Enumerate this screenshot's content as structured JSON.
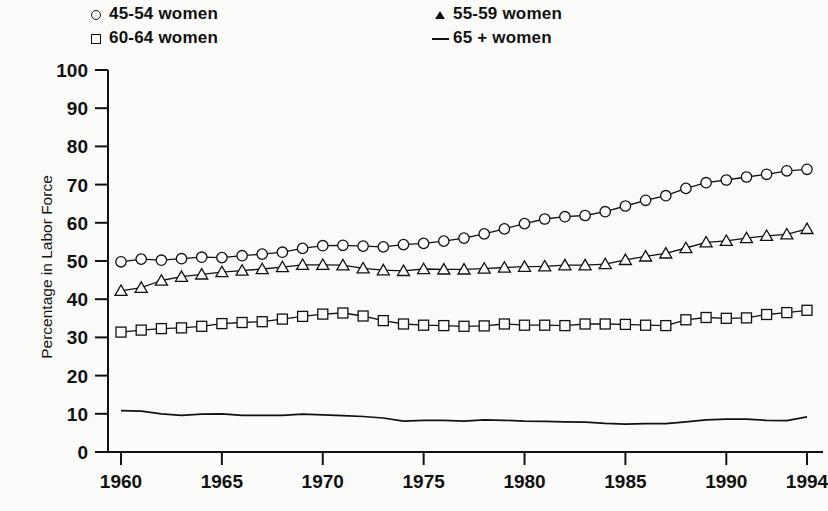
{
  "legend": {
    "columns": [
      {
        "entries": [
          {
            "marker": "circle-marker-icon",
            "label": "45-54 women"
          },
          {
            "marker": "square-marker-icon",
            "label": "60-64 women"
          }
        ]
      },
      {
        "entries": [
          {
            "marker": "triangle-marker-icon",
            "label": "55-59 women"
          },
          {
            "marker": "line-marker-icon",
            "label": "65 + women"
          }
        ]
      }
    ]
  },
  "axes": {
    "ylabel": "Percentage in Labor Force",
    "xlabel": "",
    "y_ticks": [
      "100",
      "90",
      "80",
      "70",
      "60",
      "50",
      "40",
      "30",
      "20",
      "10",
      "0"
    ],
    "x_ticks": [
      "1960",
      "1965",
      "1970",
      "1975",
      "1980",
      "1985",
      "1990",
      "1994"
    ]
  },
  "colors": {
    "ink": "#111111",
    "paper": "#fbfbf9"
  },
  "chart_data": {
    "type": "line",
    "title": "",
    "subtitle": "",
    "xlabel": "",
    "ylabel": "Percentage in Labor Force",
    "xlim": [
      1960,
      1994
    ],
    "ylim": [
      0,
      100
    ],
    "ytick_values": [
      0,
      10,
      20,
      30,
      40,
      50,
      60,
      70,
      80,
      90,
      100
    ],
    "xtick_values": [
      1960,
      1965,
      1970,
      1975,
      1980,
      1985,
      1990,
      1994
    ],
    "grid": false,
    "legend_position": "top",
    "x": [
      1960,
      1961,
      1962,
      1963,
      1964,
      1965,
      1966,
      1967,
      1968,
      1969,
      1970,
      1971,
      1972,
      1973,
      1974,
      1975,
      1976,
      1977,
      1978,
      1979,
      1980,
      1981,
      1982,
      1983,
      1984,
      1985,
      1986,
      1987,
      1988,
      1989,
      1990,
      1991,
      1992,
      1993,
      1994
    ],
    "series": [
      {
        "name": "45-54 women",
        "marker": "circle",
        "values": [
          49.8,
          50.5,
          50.2,
          50.6,
          51.0,
          50.9,
          51.4,
          51.8,
          52.3,
          53.3,
          54.0,
          54.1,
          53.9,
          53.7,
          54.3,
          54.6,
          55.2,
          56.0,
          57.1,
          58.4,
          59.8,
          61.0,
          61.6,
          61.9,
          62.9,
          64.4,
          65.9,
          67.1,
          69.0,
          70.5,
          71.2,
          72.0,
          72.7,
          73.6,
          74.0
        ]
      },
      {
        "name": "55-59 women",
        "marker": "triangle",
        "values": [
          42.2,
          43.0,
          44.9,
          45.9,
          46.5,
          47.1,
          47.5,
          47.9,
          48.4,
          49.0,
          49.0,
          48.9,
          48.1,
          47.6,
          47.4,
          47.9,
          47.8,
          47.8,
          48.0,
          48.3,
          48.5,
          48.6,
          48.9,
          48.9,
          49.2,
          50.3,
          51.2,
          52.0,
          53.4,
          54.9,
          55.3,
          56.0,
          56.6,
          57.0,
          58.4
        ]
      },
      {
        "name": "60-64 women",
        "marker": "square",
        "values": [
          31.4,
          31.9,
          32.3,
          32.5,
          32.9,
          33.6,
          33.9,
          34.1,
          34.8,
          35.5,
          36.1,
          36.4,
          35.6,
          34.4,
          33.5,
          33.2,
          33.1,
          32.9,
          33.0,
          33.5,
          33.2,
          33.2,
          33.1,
          33.5,
          33.5,
          33.4,
          33.2,
          33.1,
          34.6,
          35.2,
          35.0,
          35.1,
          36.0,
          36.5,
          37.1
        ]
      },
      {
        "name": "65 + women",
        "marker": "none",
        "values": [
          10.8,
          10.7,
          10.0,
          9.6,
          9.9,
          10.0,
          9.6,
          9.6,
          9.6,
          9.9,
          9.7,
          9.5,
          9.3,
          8.9,
          8.1,
          8.3,
          8.3,
          8.1,
          8.4,
          8.3,
          8.1,
          8.0,
          7.9,
          7.8,
          7.5,
          7.3,
          7.4,
          7.4,
          7.9,
          8.4,
          8.6,
          8.6,
          8.3,
          8.2,
          9.2
        ]
      }
    ]
  }
}
